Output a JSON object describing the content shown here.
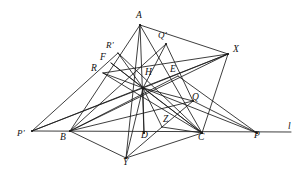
{
  "figure": {
    "background_color": "#ffffff",
    "line_color": "#1b1b1b",
    "label_color": "#111111",
    "width": 305,
    "height": 176,
    "points": [
      {
        "id": "A",
        "label": "A",
        "x": 140,
        "y": 25,
        "lx": 136,
        "ly": 11
      },
      {
        "id": "Qp",
        "label": "Q'",
        "x": 166,
        "y": 44,
        "lx": 158,
        "ly": 31
      },
      {
        "id": "X",
        "label": "X",
        "x": 228,
        "y": 54,
        "lx": 233,
        "ly": 45
      },
      {
        "id": "Rp",
        "label": "R'",
        "x": 118,
        "y": 53,
        "lx": 106,
        "ly": 41
      },
      {
        "id": "F",
        "label": "F",
        "x": 111,
        "y": 63,
        "lx": 100,
        "ly": 53
      },
      {
        "id": "E",
        "label": "E",
        "x": 178,
        "y": 76,
        "lx": 170,
        "ly": 65
      },
      {
        "id": "R",
        "label": "R",
        "x": 103,
        "y": 73,
        "lx": 91,
        "ly": 64
      },
      {
        "id": "H",
        "label": "H",
        "x": 143,
        "y": 88,
        "lx": 145,
        "ly": 68
      },
      {
        "id": "Q",
        "label": "Q",
        "x": 193,
        "y": 101,
        "lx": 192,
        "ly": 93
      },
      {
        "id": "Pp",
        "label": "P'",
        "x": 32,
        "y": 131,
        "lx": 17,
        "ly": 129
      },
      {
        "id": "B",
        "label": "B",
        "x": 70,
        "y": 131,
        "lx": 60,
        "ly": 133
      },
      {
        "id": "D",
        "label": "D",
        "x": 144,
        "y": 133,
        "lx": 141,
        "ly": 131
      },
      {
        "id": "Z",
        "label": "Z",
        "x": 162,
        "y": 127,
        "lx": 163,
        "ly": 115
      },
      {
        "id": "C",
        "label": "C",
        "x": 202,
        "y": 133,
        "lx": 198,
        "ly": 133
      },
      {
        "id": "P",
        "label": "P",
        "x": 257,
        "y": 133,
        "lx": 254,
        "ly": 131
      },
      {
        "id": "Y",
        "label": "Y",
        "x": 126,
        "y": 158,
        "lx": 123,
        "ly": 158
      },
      {
        "id": "l",
        "label": "l",
        "x": 291,
        "y": 132,
        "lx": 288,
        "ly": 122
      }
    ],
    "segments": [
      {
        "name": "side-AB",
        "from": "A",
        "to": "B"
      },
      {
        "name": "side-AC",
        "from": "A",
        "to": "C"
      },
      {
        "name": "base-line-l",
        "from": "Pp",
        "to": "l"
      },
      {
        "name": "altitude-A-D",
        "from": "A",
        "to": "D"
      },
      {
        "name": "altitude-B-E",
        "from": "B",
        "to": "E"
      },
      {
        "name": "altitude-C-F",
        "from": "C",
        "to": "F"
      },
      {
        "name": "cevian-A-H-Y",
        "from": "A",
        "to": "Y"
      },
      {
        "name": "segment-A-X",
        "from": "A",
        "to": "X"
      },
      {
        "name": "segment-X-H",
        "from": "X",
        "to": "H"
      },
      {
        "name": "segment-X-R",
        "from": "X",
        "to": "R"
      },
      {
        "name": "segment-X-C",
        "from": "X",
        "to": "C"
      },
      {
        "name": "segment-X-Pp",
        "from": "X",
        "to": "Pp"
      },
      {
        "name": "segment-B-Q",
        "from": "B",
        "to": "Q"
      },
      {
        "name": "segment-B-Qp",
        "from": "B",
        "to": "Qp"
      },
      {
        "name": "segment-B-Y",
        "from": "B",
        "to": "Y"
      },
      {
        "name": "segment-Y-C",
        "from": "Y",
        "to": "C"
      },
      {
        "name": "segment-Y-H",
        "from": "Y",
        "to": "H"
      },
      {
        "name": "segment-C-H",
        "from": "C",
        "to": "H"
      },
      {
        "name": "segment-C-Rp",
        "from": "C",
        "to": "Rp"
      },
      {
        "name": "segment-C-R",
        "from": "C",
        "to": "R"
      },
      {
        "name": "segment-C-Z",
        "from": "C",
        "to": "Z"
      },
      {
        "name": "segment-H-Z",
        "from": "H",
        "to": "Z"
      },
      {
        "name": "segment-H-D",
        "from": "H",
        "to": "D"
      },
      {
        "name": "segment-H-Q",
        "from": "H",
        "to": "Q"
      },
      {
        "name": "segment-H-Qp",
        "from": "H",
        "to": "Qp"
      },
      {
        "name": "segment-H-Rp",
        "from": "H",
        "to": "Rp"
      },
      {
        "name": "segment-H-F",
        "from": "H",
        "to": "F"
      },
      {
        "name": "segment-H-R",
        "from": "H",
        "to": "R"
      },
      {
        "name": "segment-H-Pp",
        "from": "H",
        "to": "Pp"
      },
      {
        "name": "segment-H-P",
        "from": "H",
        "to": "P"
      },
      {
        "name": "segment-Qp-Q",
        "from": "Qp",
        "to": "Q"
      },
      {
        "name": "segment-Q-Z",
        "from": "Q",
        "to": "Z"
      },
      {
        "name": "segment-Z-Y",
        "from": "Z",
        "to": "Y"
      },
      {
        "name": "segment-Rp-Pp",
        "from": "Rp",
        "to": "Pp"
      },
      {
        "name": "segment-E-P",
        "from": "E",
        "to": "P"
      },
      {
        "name": "segment-Q-P",
        "from": "Q",
        "to": "P"
      },
      {
        "name": "segment-B-X-upper",
        "from": "B",
        "to": "X"
      }
    ]
  }
}
